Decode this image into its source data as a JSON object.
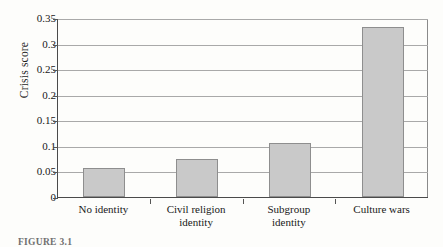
{
  "figure": {
    "caption_prefix": "FIGURE 3.1",
    "caption_text": "FIGURE 3.1  Culture wars and crisis scores: higher争 crisis among culture-war identities."
  },
  "chart_data": {
    "type": "bar",
    "title": "",
    "xlabel": "",
    "ylabel": "Crisis score",
    "categories": [
      "No identity",
      "Civil religion identity",
      "Subgroup identity",
      "Culture wars"
    ],
    "category_lines": [
      [
        "No identity"
      ],
      [
        "Civil religion",
        "identity"
      ],
      [
        "Subgroup",
        "identity"
      ],
      [
        "Culture wars"
      ]
    ],
    "values": [
      0.057,
      0.074,
      0.105,
      0.333
    ],
    "ylim": [
      0,
      0.35
    ],
    "ytick_values": [
      0,
      0.05,
      0.1,
      0.15,
      0.2,
      0.25,
      0.3,
      0.35
    ],
    "ytick_labels": [
      "0",
      "0.05",
      "0.1",
      "0.15",
      "0.2",
      "0.25",
      "0.3",
      "0.35"
    ],
    "grid": true,
    "legend": "none",
    "bar_fill": "#c9c9c9",
    "bar_border": "#8e8e8e",
    "axis_color": "#4a4a4a",
    "grid_color": "#a9a9a9"
  }
}
